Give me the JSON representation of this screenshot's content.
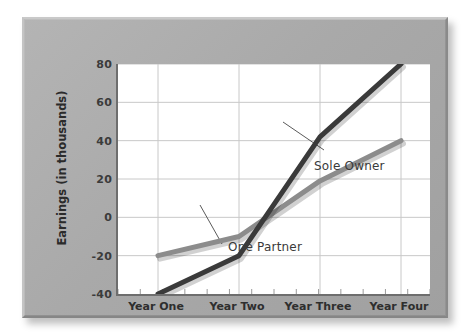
{
  "chart_data": {
    "type": "line",
    "title": "",
    "subtitle": "",
    "xlabel": "",
    "ylabel": "Earnings (in thousands)",
    "categories": [
      "Year One",
      "Year Two",
      "Year Three",
      "Year Four"
    ],
    "series": [
      {
        "name": "Sole Owner",
        "values": [
          -40,
          -20,
          42,
          80
        ],
        "color": "#3a3a3a"
      },
      {
        "name": "One Partner",
        "values": [
          -20,
          -10,
          19,
          40
        ],
        "color": "#8c8c8c"
      }
    ],
    "ylim": [
      -40,
      80
    ],
    "yticks": [
      80,
      60,
      40,
      20,
      0,
      -20,
      -40
    ],
    "ytick_labels": [
      "80",
      "60",
      "40",
      "20",
      "0",
      "-20",
      "-40"
    ],
    "grid": "both",
    "legend": "annotations-on-plot",
    "annotations": [
      {
        "text": "Sole Owner",
        "for_series": "Sole Owner"
      },
      {
        "text": "One Partner",
        "for_series": "One Partner"
      }
    ],
    "colors": {
      "sole_owner_line": "#3a3a3a",
      "one_partner_line": "#8c8c8c",
      "plot_background": "#ffffff",
      "panel_background": "#a9a9a9",
      "gridline": "#c8c8c8",
      "axis": "#6e6e6e"
    }
  }
}
